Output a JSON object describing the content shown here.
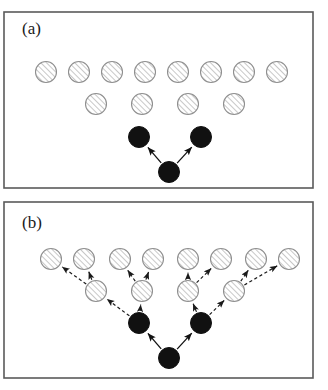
{
  "figure": {
    "background_color": "#ffffff",
    "border_color": "#5a5a5a",
    "hatch_fill_color": "#ffffff",
    "hatch_line_color": "#9a9a9a",
    "hatch_edge_color": "#8f8f8f",
    "solid_node_color": "#111111",
    "solid_arrow_color": "#111111",
    "dashed_arrow_color": "#1a1a1a",
    "node_radius": 10.5
  },
  "panels": [
    {
      "id": "panel-a",
      "label": "(a)",
      "label_x": 22,
      "label_y": 34,
      "frame": {
        "x": 4,
        "y": 12,
        "width": 309,
        "height": 176
      },
      "arrow_style": "solid",
      "nodes": [
        {
          "id": "a-top-1",
          "kind": "hatched",
          "cx": 46,
          "cy": 72
        },
        {
          "id": "a-top-2",
          "kind": "hatched",
          "cx": 79,
          "cy": 72
        },
        {
          "id": "a-top-3",
          "kind": "hatched",
          "cx": 112,
          "cy": 72
        },
        {
          "id": "a-top-4",
          "kind": "hatched",
          "cx": 145,
          "cy": 72
        },
        {
          "id": "a-top-5",
          "kind": "hatched",
          "cx": 178,
          "cy": 72
        },
        {
          "id": "a-top-6",
          "kind": "hatched",
          "cx": 211,
          "cy": 72
        },
        {
          "id": "a-top-7",
          "kind": "hatched",
          "cx": 244,
          "cy": 72
        },
        {
          "id": "a-top-8",
          "kind": "hatched",
          "cx": 277,
          "cy": 72
        },
        {
          "id": "a-mid-1",
          "kind": "hatched",
          "cx": 96,
          "cy": 104
        },
        {
          "id": "a-mid-2",
          "kind": "hatched",
          "cx": 142,
          "cy": 104
        },
        {
          "id": "a-mid-3",
          "kind": "hatched",
          "cx": 188,
          "cy": 104
        },
        {
          "id": "a-mid-4",
          "kind": "hatched",
          "cx": 234,
          "cy": 104
        },
        {
          "id": "a-black-left",
          "kind": "solid",
          "cx": 139,
          "cy": 137
        },
        {
          "id": "a-black-right",
          "kind": "solid",
          "cx": 201,
          "cy": 137
        },
        {
          "id": "a-black-root",
          "kind": "solid",
          "cx": 169,
          "cy": 172
        }
      ],
      "arrows": [
        {
          "id": "a-arrow-root-left",
          "from": "a-black-root",
          "to": "a-black-left",
          "style": "solid"
        },
        {
          "id": "a-arrow-root-right",
          "from": "a-black-root",
          "to": "a-black-right",
          "style": "solid"
        }
      ]
    },
    {
      "id": "panel-b",
      "label": "(b)",
      "label_x": 22,
      "label_y": 228,
      "frame": {
        "x": 4,
        "y": 202,
        "width": 309,
        "height": 176
      },
      "arrow_style": "mixed",
      "nodes": [
        {
          "id": "b-top-1",
          "kind": "hatched",
          "cx": 51,
          "cy": 259
        },
        {
          "id": "b-top-2",
          "kind": "hatched",
          "cx": 84,
          "cy": 259
        },
        {
          "id": "b-top-3",
          "kind": "hatched",
          "cx": 120,
          "cy": 259
        },
        {
          "id": "b-top-4",
          "kind": "hatched",
          "cx": 153,
          "cy": 259
        },
        {
          "id": "b-top-5",
          "kind": "hatched",
          "cx": 188,
          "cy": 259
        },
        {
          "id": "b-top-6",
          "kind": "hatched",
          "cx": 221,
          "cy": 259
        },
        {
          "id": "b-top-7",
          "kind": "hatched",
          "cx": 256,
          "cy": 259
        },
        {
          "id": "b-top-8",
          "kind": "hatched",
          "cx": 289,
          "cy": 259
        },
        {
          "id": "b-mid-1",
          "kind": "hatched",
          "cx": 96,
          "cy": 291
        },
        {
          "id": "b-mid-2",
          "kind": "hatched",
          "cx": 142,
          "cy": 291
        },
        {
          "id": "b-mid-3",
          "kind": "hatched",
          "cx": 188,
          "cy": 291
        },
        {
          "id": "b-mid-4",
          "kind": "hatched",
          "cx": 234,
          "cy": 291
        },
        {
          "id": "b-black-left",
          "kind": "solid",
          "cx": 139,
          "cy": 323
        },
        {
          "id": "b-black-right",
          "kind": "solid",
          "cx": 201,
          "cy": 323
        },
        {
          "id": "b-black-root",
          "kind": "solid",
          "cx": 169,
          "cy": 358
        }
      ],
      "arrows": [
        {
          "id": "b-arrow-root-left",
          "from": "b-black-root",
          "to": "b-black-left",
          "style": "solid"
        },
        {
          "id": "b-arrow-root-right",
          "from": "b-black-root",
          "to": "b-black-right",
          "style": "solid"
        },
        {
          "id": "b-arrow-bl-m1",
          "from": "b-black-left",
          "to": "b-mid-1",
          "style": "dashed"
        },
        {
          "id": "b-arrow-bl-m2",
          "from": "b-black-left",
          "to": "b-mid-2",
          "style": "dashed"
        },
        {
          "id": "b-arrow-br-m3",
          "from": "b-black-right",
          "to": "b-mid-3",
          "style": "dashed"
        },
        {
          "id": "b-arrow-br-m4",
          "from": "b-black-right",
          "to": "b-mid-4",
          "style": "dashed"
        },
        {
          "id": "b-arrow-m1-t1",
          "from": "b-mid-1",
          "to": "b-top-1",
          "style": "dashed"
        },
        {
          "id": "b-arrow-m1-t2",
          "from": "b-mid-1",
          "to": "b-top-2",
          "style": "dashed"
        },
        {
          "id": "b-arrow-m2-t3",
          "from": "b-mid-2",
          "to": "b-top-3",
          "style": "dashed"
        },
        {
          "id": "b-arrow-m2-t4",
          "from": "b-mid-2",
          "to": "b-top-4",
          "style": "dashed"
        },
        {
          "id": "b-arrow-m3-t5",
          "from": "b-mid-3",
          "to": "b-top-5",
          "style": "dashed"
        },
        {
          "id": "b-arrow-m3-t6",
          "from": "b-mid-3",
          "to": "b-top-6",
          "style": "dashed"
        },
        {
          "id": "b-arrow-m4-t7",
          "from": "b-mid-4",
          "to": "b-top-7",
          "style": "dashed"
        },
        {
          "id": "b-arrow-m4-t8",
          "from": "b-mid-4",
          "to": "b-top-8",
          "style": "dashed"
        }
      ]
    }
  ]
}
